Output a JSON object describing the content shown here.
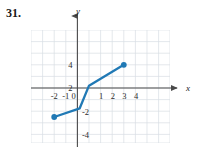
{
  "problem": {
    "number": "31."
  },
  "chart_data": {
    "type": "line",
    "title": "",
    "subtitle": "",
    "xlabel": "x",
    "ylabel": "y",
    "xlim": [
      -2.95,
      5.05
    ],
    "ylim": [
      -4.8,
      5.0
    ],
    "grid": true,
    "grid_step": 1,
    "legend": "none",
    "x_ticks": [
      -2,
      -1,
      0,
      1,
      2,
      3,
      4
    ],
    "x_tick_labels": [
      "-2",
      "-1",
      "0",
      "1",
      "2",
      "3",
      "4"
    ],
    "y_ticks": [
      4,
      2,
      -2,
      -4
    ],
    "y_tick_labels": [
      "4",
      "2",
      "-2",
      "-4"
    ],
    "series": [
      {
        "name": "piecewise-linear-graph",
        "color": "#2079b5",
        "x": [
          -2,
          0.2,
          1,
          4
        ],
        "y": [
          -2.5,
          -1.75,
          0.2,
          2
        ],
        "endpoints": [
          {
            "x": -2,
            "y": -2.5,
            "filled": true
          },
          {
            "x": 4,
            "y": 2,
            "filled": true
          }
        ]
      }
    ],
    "annotations": []
  },
  "colors": {
    "curve": "#2079b5",
    "grid": "#d6dbe2",
    "axis": "#4a4a4a",
    "text": "#1a1a1a"
  },
  "axis_labels": {
    "x": "x",
    "y": "y"
  }
}
